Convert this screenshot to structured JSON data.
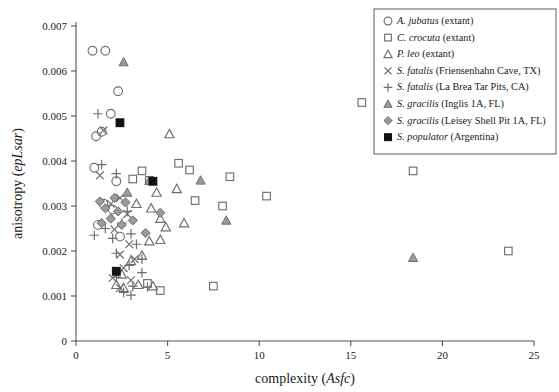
{
  "chart_data": {
    "type": "scatter",
    "title": "",
    "xlabel": "complexity (Asfc)",
    "xlabel_plain": "complexity",
    "xlabel_italic": "Asfc",
    "ylabel": "anisotropy (epLsar)",
    "ylabel_plain": "anisotropy",
    "ylabel_italic": "epLsar",
    "xlim": [
      0,
      25
    ],
    "ylim": [
      0,
      0.007
    ],
    "xticks": [
      "0",
      "5",
      "10",
      "15",
      "20",
      "25"
    ],
    "xtick_values": [
      0,
      5,
      10,
      15,
      20,
      25
    ],
    "yticks": [
      "0",
      "0.001",
      "0.002",
      "0.003",
      "0.004",
      "0.005",
      "0.006",
      "0.007"
    ],
    "ytick_values": [
      0,
      0.001,
      0.002,
      0.003,
      0.004,
      0.005,
      0.006,
      0.007
    ],
    "grid": false,
    "legend_position": "top-right",
    "series": [
      {
        "name": "A. jubatus (extant)",
        "name_italic": "A. jubatus",
        "name_plain": "(extant)",
        "marker": "circle-open",
        "color": "#6f6f6f",
        "points": [
          [
            0.9,
            0.00645
          ],
          [
            1.6,
            0.00645
          ],
          [
            2.3,
            0.00555
          ],
          [
            1.9,
            0.00505
          ],
          [
            1.4,
            0.00465
          ],
          [
            1.1,
            0.00455
          ],
          [
            1.0,
            0.00385
          ],
          [
            2.2,
            0.00355
          ],
          [
            1.5,
            0.00305
          ],
          [
            2.0,
            0.00292
          ],
          [
            1.2,
            0.00258
          ],
          [
            2.4,
            0.00232
          ]
        ]
      },
      {
        "name": "C. crocuta (extant)",
        "name_italic": "C. crocuta",
        "name_plain": "(extant)",
        "marker": "square-open",
        "color": "#6f6f6f",
        "points": [
          [
            15.6,
            0.0053
          ],
          [
            3.6,
            0.00378
          ],
          [
            3.1,
            0.0036
          ],
          [
            4.0,
            0.00357
          ],
          [
            5.6,
            0.00395
          ],
          [
            6.2,
            0.0038
          ],
          [
            8.4,
            0.00365
          ],
          [
            6.5,
            0.00312
          ],
          [
            8.0,
            0.003
          ],
          [
            10.4,
            0.00322
          ],
          [
            7.5,
            0.00122
          ],
          [
            23.6,
            0.002
          ],
          [
            18.4,
            0.00378
          ],
          [
            3.9,
            0.00128
          ],
          [
            4.6,
            0.00112
          ]
        ]
      },
      {
        "name": "P. leo (extant)",
        "name_italic": "P. leo",
        "name_plain": "(extant)",
        "marker": "triangle-open",
        "color": "#6f6f6f",
        "points": [
          [
            5.1,
            0.0046
          ],
          [
            4.4,
            0.0033
          ],
          [
            3.3,
            0.00305
          ],
          [
            5.5,
            0.00338
          ],
          [
            4.1,
            0.00295
          ],
          [
            4.6,
            0.00272
          ],
          [
            4.9,
            0.00253
          ],
          [
            5.9,
            0.00262
          ],
          [
            4.0,
            0.00222
          ],
          [
            4.6,
            0.00225
          ],
          [
            3.6,
            0.0019
          ],
          [
            3.0,
            0.00178
          ],
          [
            2.5,
            0.00148
          ],
          [
            3.4,
            0.00125
          ],
          [
            4.2,
            0.00122
          ],
          [
            2.2,
            0.00125
          ],
          [
            2.6,
            0.00118
          ]
        ]
      },
      {
        "name": "S. fatalis (Friensenhahn Cave, TX)",
        "name_italic": "S. fatalis",
        "name_plain": "(Friensenhahn Cave, TX)",
        "marker": "cross",
        "color": "#6f6f6f",
        "points": [
          [
            1.5,
            0.00468
          ],
          [
            1.3,
            0.00368
          ],
          [
            2.4,
            0.00318
          ],
          [
            1.9,
            0.00305
          ],
          [
            2.8,
            0.00282
          ],
          [
            2.1,
            0.00248
          ],
          [
            2.9,
            0.00215
          ],
          [
            2.4,
            0.00192
          ],
          [
            3.2,
            0.00182
          ],
          [
            2.6,
            0.00162
          ],
          [
            2.0,
            0.0014
          ],
          [
            3.0,
            0.00135
          ],
          [
            2.4,
            0.00118
          ]
        ]
      },
      {
        "name": "S. fatalis (La Brea Tar Pits, CA)",
        "name_italic": "S. fatalis",
        "name_plain": "(La Brea Tar Pits, CA)",
        "marker": "plus",
        "color": "#6f6f6f",
        "points": [
          [
            1.2,
            0.00505
          ],
          [
            1.4,
            0.00392
          ],
          [
            2.2,
            0.00372
          ],
          [
            2.8,
            0.00288
          ],
          [
            2.5,
            0.00262
          ],
          [
            1.6,
            0.0025
          ],
          [
            1.0,
            0.00235
          ],
          [
            2.0,
            0.00228
          ],
          [
            3.0,
            0.00238
          ],
          [
            3.3,
            0.00215
          ],
          [
            2.2,
            0.00195
          ],
          [
            3.6,
            0.00182
          ],
          [
            2.9,
            0.00168
          ],
          [
            3.6,
            0.00152
          ],
          [
            2.2,
            0.00142
          ],
          [
            3.1,
            0.00122
          ],
          [
            3.9,
            0.0012
          ],
          [
            2.6,
            0.00108
          ],
          [
            3.0,
            0.00102
          ]
        ]
      },
      {
        "name": "S. gracilis (Inglis 1A, FL)",
        "name_italic": "S. gracilis",
        "name_plain": "(Inglis 1A, FL)",
        "marker": "triangle-filled",
        "color": "#9a9a9a",
        "points": [
          [
            2.6,
            0.0062
          ],
          [
            2.8,
            0.0033
          ],
          [
            4.0,
            0.00356
          ],
          [
            6.8,
            0.00357
          ],
          [
            8.2,
            0.00268
          ],
          [
            18.4,
            0.00185
          ]
        ]
      },
      {
        "name": "S. gracilis (Leisey Shell Pit 1A, FL)",
        "name_italic": "S. gracilis",
        "name_plain": "(Leisey Shell Pit 1A, FL)",
        "marker": "diamond-filled",
        "color": "#9a9a9a",
        "points": [
          [
            1.3,
            0.0031
          ],
          [
            2.1,
            0.00318
          ],
          [
            2.7,
            0.00308
          ],
          [
            1.6,
            0.00295
          ],
          [
            2.3,
            0.00288
          ],
          [
            1.9,
            0.00272
          ],
          [
            1.4,
            0.00262
          ],
          [
            2.5,
            0.00258
          ],
          [
            3.1,
            0.00268
          ],
          [
            3.8,
            0.0024
          ],
          [
            4.6,
            0.00285
          ]
        ]
      },
      {
        "name": "S. populator (Argentina)",
        "name_italic": "S. populator",
        "name_plain": "(Argentina)",
        "marker": "square-filled",
        "color": "#111111",
        "points": [
          [
            2.4,
            0.00485
          ],
          [
            4.2,
            0.00355
          ],
          [
            2.2,
            0.00155
          ]
        ]
      }
    ]
  },
  "legend": {
    "items": [
      {
        "marker": "circle-open",
        "italic": "A. jubatus",
        "plain": "(extant)"
      },
      {
        "marker": "square-open",
        "italic": "C. crocuta",
        "plain": "(extant)"
      },
      {
        "marker": "triangle-open",
        "italic": "P. leo",
        "plain": "(extant)"
      },
      {
        "marker": "cross",
        "italic": "S. fatalis",
        "plain": "(Friensenhahn Cave, TX)"
      },
      {
        "marker": "plus",
        "italic": "S. fatalis",
        "plain": "(La Brea Tar Pits, CA)"
      },
      {
        "marker": "triangle-filled",
        "italic": "S. gracilis",
        "plain": "(Inglis 1A, FL)"
      },
      {
        "marker": "diamond-filled",
        "italic": "S. gracilis",
        "plain": "(Leisey Shell Pit 1A, FL)"
      },
      {
        "marker": "square-filled",
        "italic": "S. populator",
        "plain": "(Argentina)"
      }
    ]
  },
  "colors": {
    "open_marker": "#6f6f6f",
    "gray_marker": "#9a9a9a",
    "black_marker": "#111111",
    "axis": "#555555",
    "background": "#ffffff"
  }
}
